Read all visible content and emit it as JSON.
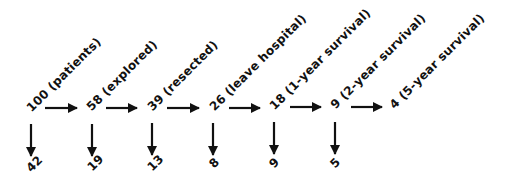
{
  "diagram": {
    "type": "flow",
    "direction": "left-to-right",
    "stages": [
      {
        "count": "100",
        "label": "100 (patients)",
        "drop": "42"
      },
      {
        "count": "58",
        "label": "58 (explored)",
        "drop": "19"
      },
      {
        "count": "39",
        "label": "39 (resected)",
        "drop": "13"
      },
      {
        "count": "26",
        "label": "26 (leave hospital)",
        "drop": "8"
      },
      {
        "count": "18",
        "label": "18 (1-year survival)",
        "drop": "9"
      },
      {
        "count": "9",
        "label": "9 (2-year survival)",
        "drop": "5"
      },
      {
        "count": "4",
        "label": "4 (5-year survival)",
        "drop": null
      }
    ],
    "colors": {
      "ink": "#111111",
      "background": "#ffffff"
    }
  }
}
